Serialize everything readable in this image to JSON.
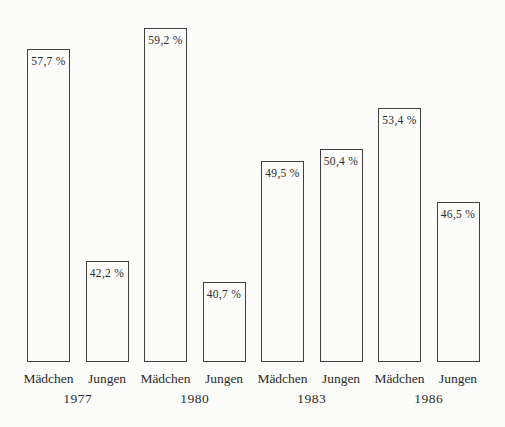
{
  "page": {
    "background": "#fcfcfa"
  },
  "chart_data": {
    "type": "bar",
    "title": "",
    "unit": "%",
    "decimal_separator": ",",
    "categories": [
      "1977",
      "1980",
      "1983",
      "1986"
    ],
    "series": [
      {
        "name": "Mädchen",
        "values": [
          57.7,
          59.2,
          49.5,
          53.4
        ]
      },
      {
        "name": "Jungen",
        "values": [
          42.2,
          40.7,
          50.4,
          46.5
        ]
      }
    ],
    "groups": [
      {
        "year": "1977",
        "bars": [
          {
            "label": "Mädchen",
            "value": 57.7,
            "display": "57,7 %"
          },
          {
            "label": "Jungen",
            "value": 42.2,
            "display": "42,2 %"
          }
        ]
      },
      {
        "year": "1980",
        "bars": [
          {
            "label": "Mädchen",
            "value": 59.2,
            "display": "59,2 %"
          },
          {
            "label": "Jungen",
            "value": 40.7,
            "display": "40,7 %"
          }
        ]
      },
      {
        "year": "1983",
        "bars": [
          {
            "label": "Mädchen",
            "value": 49.5,
            "display": "49,5 %"
          },
          {
            "label": "Jungen",
            "value": 50.4,
            "display": "50,4 %"
          }
        ]
      },
      {
        "year": "1986",
        "bars": [
          {
            "label": "Mädchen",
            "value": 53.4,
            "display": "53,4 %"
          },
          {
            "label": "Jungen",
            "value": 46.5,
            "display": "46,5 %"
          }
        ]
      }
    ],
    "layout": {
      "grid": false,
      "legend": false,
      "value_labels_inside_bar_top": true,
      "baseline_y": 362,
      "value_at_baseline": 34.85,
      "px_per_percent": 13.7,
      "first_bar_left": 27,
      "bar_spacing": 58.5,
      "bar_width": 43,
      "category_label_y": 371,
      "year_label_y": 391
    },
    "colors": {
      "bar_fill": "#fcfcfa",
      "bar_border": "#3f3f3f",
      "text": "#2b2b2b"
    }
  }
}
